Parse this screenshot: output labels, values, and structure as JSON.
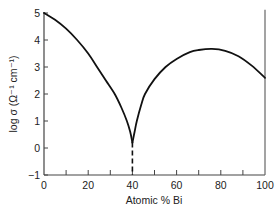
{
  "chart_data": {
    "type": "line",
    "title": "",
    "xlabel": "Atomic % Bi",
    "ylabel": "log σ (Ω⁻¹ cm⁻¹)",
    "xlim": [
      0,
      100
    ],
    "ylim": [
      -1,
      5
    ],
    "x_ticks": [
      0,
      20,
      40,
      60,
      80,
      100
    ],
    "x_minor_ticks": [
      10,
      30,
      50,
      70,
      90
    ],
    "y_ticks": [
      5,
      4,
      3,
      2,
      1,
      0,
      -1
    ],
    "grid": false,
    "legend": null,
    "series": [
      {
        "name": "conductivity",
        "style": "solid",
        "x": [
          0,
          5,
          10,
          15,
          20,
          24,
          28,
          32,
          35,
          37.5,
          39,
          40
        ],
        "y": [
          5.0,
          4.75,
          4.42,
          4.0,
          3.5,
          3.0,
          2.5,
          2.0,
          1.5,
          1.0,
          0.6,
          0.2
        ]
      },
      {
        "name": "conductivity-right-branch",
        "style": "solid",
        "x": [
          40,
          41,
          42,
          44,
          45.7,
          50,
          55,
          60,
          66,
          70,
          76,
          82,
          88,
          94,
          100
        ],
        "y": [
          0.2,
          0.6,
          1.0,
          1.6,
          2.0,
          2.55,
          3.0,
          3.3,
          3.55,
          3.63,
          3.67,
          3.6,
          3.4,
          3.05,
          2.6
        ]
      },
      {
        "name": "minimum-marker",
        "style": "dashed",
        "x": [
          40,
          40
        ],
        "y": [
          0.2,
          -1.0
        ]
      }
    ],
    "annotations": [
      {
        "type": "vertical-line",
        "x": 100,
        "y_range": [
          -1,
          5.1
        ]
      }
    ]
  }
}
